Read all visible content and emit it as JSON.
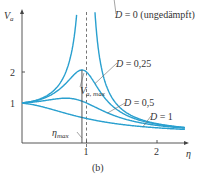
{
  "chart_data": {
    "type": "line",
    "title": "",
    "caption": "(b)",
    "xlabel": "η",
    "ylabel": "V_a",
    "xlim": [
      0,
      2.4
    ],
    "ylim": [
      0,
      3.2
    ],
    "x_ticks": [
      "1",
      "2"
    ],
    "y_ticks": [
      "1",
      "2"
    ],
    "grid": false,
    "reference_line": {
      "x": 1,
      "style": "dashed"
    },
    "annotations": {
      "vmax": "V",
      "vmax_sub": "a, max",
      "etamax": "η",
      "etamax_sub": "max"
    },
    "series": [
      {
        "name": "D = 0 (ungedämpft)",
        "D": 0
      },
      {
        "name": "D = 0,25",
        "D": 0.25
      },
      {
        "name": "D = 0,5",
        "D": 0.5
      },
      {
        "name": "D = 1",
        "D": 1
      }
    ],
    "formula": "V = 1 / sqrt((1 - η²)² + (2Dη)²)",
    "colors": {
      "curve": "#2aa0cf",
      "axis": "#444444"
    }
  }
}
